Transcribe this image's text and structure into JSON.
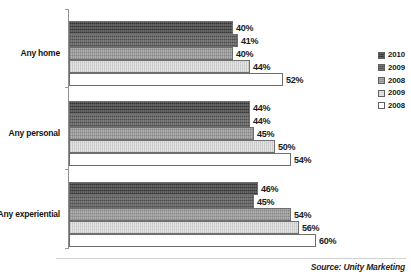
{
  "chart_data": {
    "type": "bar",
    "orientation": "horizontal",
    "title": "",
    "xlabel": "",
    "ylabel": "",
    "xlim": [
      0,
      72
    ],
    "grid": false,
    "legend_position": "right",
    "categories": [
      "Any home",
      "Any personal",
      "Any experiential"
    ],
    "series": [
      {
        "name": "2010",
        "color": "#3c3c3c",
        "values": [
          40,
          44,
          46
        ],
        "labels": [
          "40%",
          "44%",
          "46%"
        ]
      },
      {
        "name": "2009",
        "color": "#575757",
        "values": [
          41,
          44,
          45
        ],
        "labels": [
          "41%",
          "44%",
          "45%"
        ]
      },
      {
        "name": "2008",
        "color": "#969696",
        "values": [
          40,
          45,
          54
        ],
        "labels": [
          "40%",
          "45%",
          "54%"
        ]
      },
      {
        "name": "2009",
        "color": "#dcdcdc",
        "values": [
          44,
          50,
          56
        ],
        "labels": [
          "44%",
          "50%",
          "56%"
        ]
      },
      {
        "name": "2008",
        "color": "#ffffff",
        "values": [
          52,
          54,
          60
        ],
        "labels": [
          "52%",
          "54%",
          "60%"
        ]
      }
    ]
  },
  "legend": {
    "items": [
      {
        "label": "2010",
        "color": "#3c3c3c"
      },
      {
        "label": "2009",
        "color": "#575757"
      },
      {
        "label": "2008",
        "color": "#969696"
      },
      {
        "label": "2009",
        "color": "#dcdcdc"
      },
      {
        "label": "2008",
        "color": "#ffffff"
      }
    ]
  },
  "footer": {
    "source": "Source: Unity Marketing"
  }
}
